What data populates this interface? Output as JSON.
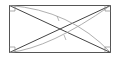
{
  "diagram": {
    "type": "geometry",
    "colors": {
      "rectangle": "#555555",
      "diagonals": "#444444",
      "arcs": "#9a9a9a",
      "markers": "#888888"
    },
    "rectangle": {
      "x1": 9,
      "y1": 5,
      "x2": 111,
      "y2": 53
    },
    "labels": []
  }
}
